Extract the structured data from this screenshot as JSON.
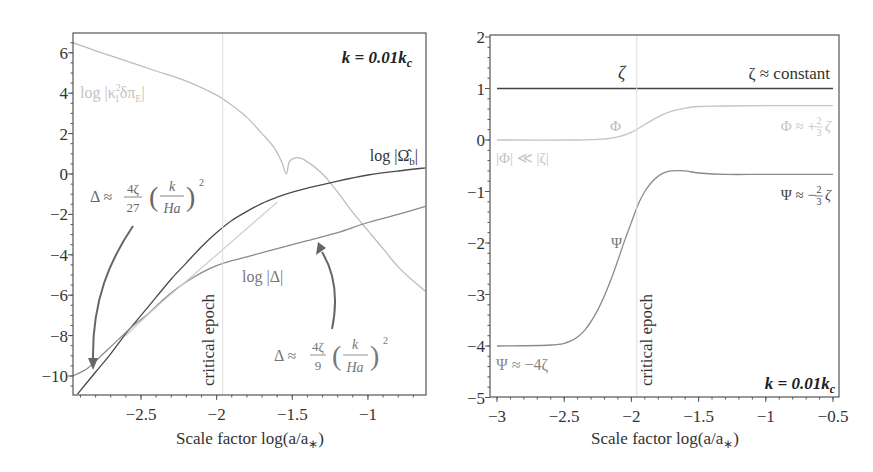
{
  "chart_data": [
    {
      "type": "line",
      "panel": "left",
      "title": "",
      "annotation_title": "k = 0.01k_c",
      "xlabel": "Scale factor log(a/a*)",
      "ylabel": "",
      "xlim": [
        -2.95,
        -0.62
      ],
      "ylim": [
        -11,
        6.8
      ],
      "xticks": [
        -2.5,
        -2,
        -1.5,
        -1
      ],
      "xtick_labels": [
        "−2.5",
        "−2",
        "−1.5",
        "−1"
      ],
      "yticks": [
        6,
        4,
        2,
        0,
        -2,
        -4,
        -6,
        -8,
        -10
      ],
      "ytick_labels": [
        "6",
        "4",
        "2",
        "0",
        "−2",
        "−4",
        "−6",
        "−8",
        "−10"
      ],
      "grid": false,
      "vline": {
        "x": -1.96,
        "label": "critical epoch"
      },
      "series": [
        {
          "name": "log|κ₁²δπ_E|",
          "color": "#bdbdbd",
          "x": [
            -2.95,
            -2.8,
            -2.6,
            -2.4,
            -2.2,
            -2.0,
            -1.9,
            -1.8,
            -1.7,
            -1.62,
            -1.57,
            -1.54,
            -1.52,
            -1.48,
            -1.42,
            -1.3,
            -1.2,
            -1.1,
            -1.0,
            -0.9,
            -0.8,
            -0.7,
            -0.62
          ],
          "y": [
            6.5,
            6.1,
            5.6,
            5.1,
            4.6,
            3.9,
            3.4,
            2.8,
            2.0,
            1.3,
            0.6,
            0.0,
            0.6,
            0.8,
            0.7,
            0.0,
            -0.9,
            -1.9,
            -2.8,
            -3.7,
            -4.6,
            -5.3,
            -5.8
          ]
        },
        {
          "name": "log|Ω̂_b|",
          "color": "#4a4a4a",
          "x": [
            -2.92,
            -2.8,
            -2.7,
            -2.6,
            -2.5,
            -2.4,
            -2.3,
            -2.2,
            -2.1,
            -2.0,
            -1.9,
            -1.8,
            -1.7,
            -1.6,
            -1.5,
            -1.4,
            -1.2,
            -1.0,
            -0.8,
            -0.62
          ],
          "y": [
            -10.9,
            -9.8,
            -8.9,
            -7.9,
            -7.0,
            -6.1,
            -5.2,
            -4.4,
            -3.6,
            -2.9,
            -2.3,
            -1.85,
            -1.45,
            -1.15,
            -0.9,
            -0.7,
            -0.35,
            -0.05,
            0.15,
            0.3
          ]
        },
        {
          "name": "log|Δ|",
          "color": "#8a8a8a",
          "x": [
            -2.95,
            -2.85,
            -2.75,
            -2.65,
            -2.55,
            -2.45,
            -2.35,
            -2.25,
            -2.15,
            -2.05,
            -1.95,
            -1.8,
            -1.6,
            -1.4,
            -1.2,
            -1.0,
            -0.8,
            -0.62
          ],
          "y": [
            -10.0,
            -9.6,
            -8.9,
            -8.2,
            -7.5,
            -6.9,
            -6.2,
            -5.6,
            -5.1,
            -4.7,
            -4.4,
            -4.1,
            -3.7,
            -3.3,
            -2.9,
            -2.4,
            -2.0,
            -1.6
          ]
        },
        {
          "name": "Δ ≈ (4ζ/9)(k/Ha)² asymptote",
          "color": "#d0d0d0",
          "x": [
            -2.6,
            -2.4,
            -2.2,
            -2.0,
            -1.8,
            -1.6
          ],
          "y": [
            -8.0,
            -6.6,
            -5.3,
            -4.0,
            -2.7,
            -1.4
          ]
        }
      ],
      "labels": [
        {
          "text": "k = 0.01k_c",
          "x": -0.8,
          "y": 5.9
        },
        {
          "text": "log|κ₁²δπ_E|",
          "x": -2.75,
          "y": 4.1
        },
        {
          "text": "log|Ω̂_b|",
          "x": -0.9,
          "y": 1.0
        },
        {
          "text": "log|Δ|",
          "x": -1.8,
          "y": -5.2
        },
        {
          "text": "Δ ≈ (4ζ/27)(k/Ha)²",
          "x": -2.7,
          "y": -1.6
        },
        {
          "text": "Δ ≈ (4ζ/9)(k/Ha)²",
          "x": -1.4,
          "y": -8.7
        }
      ]
    },
    {
      "type": "line",
      "panel": "right",
      "title": "",
      "annotation_title": "k = 0.01k_c",
      "xlabel": "Scale factor log(a/a*)",
      "ylabel": "",
      "xlim": [
        -3.05,
        -0.45
      ],
      "ylim": [
        -5,
        2
      ],
      "xticks": [
        -3,
        -2.5,
        -2,
        -1.5,
        -1,
        -0.5
      ],
      "xtick_labels": [
        "−3",
        "−2.5",
        "−2",
        "−1.5",
        "−1",
        "−0.5"
      ],
      "yticks": [
        2,
        1,
        0,
        -1,
        -2,
        -3,
        -4,
        -5
      ],
      "ytick_labels": [
        "2",
        "1",
        "0",
        "−1",
        "−2",
        "−3",
        "−4",
        "−5"
      ],
      "grid": false,
      "vline": {
        "x": -1.96,
        "label": "critical epoch"
      },
      "series": [
        {
          "name": "ζ",
          "color": "#444444",
          "x": [
            -3.0,
            -0.5
          ],
          "y": [
            1.0,
            1.0
          ]
        },
        {
          "name": "Φ",
          "color": "#c4c4c4",
          "x": [
            -3.0,
            -2.4,
            -2.2,
            -2.1,
            -2.0,
            -1.9,
            -1.8,
            -1.7,
            -1.6,
            -1.5,
            -1.3,
            -1.0,
            -0.5
          ],
          "y": [
            0.0,
            0.0,
            0.02,
            0.06,
            0.15,
            0.3,
            0.45,
            0.56,
            0.62,
            0.65,
            0.66,
            0.667,
            0.667
          ]
        },
        {
          "name": "Ψ",
          "color": "#8a8a8a",
          "x": [
            -3.0,
            -2.6,
            -2.45,
            -2.35,
            -2.25,
            -2.15,
            -2.05,
            -2.0,
            -1.95,
            -1.9,
            -1.85,
            -1.8,
            -1.75,
            -1.7,
            -1.6,
            -1.5,
            -1.3,
            -1.0,
            -0.5
          ],
          "y": [
            -4.0,
            -3.98,
            -3.9,
            -3.7,
            -3.3,
            -2.7,
            -1.95,
            -1.6,
            -1.25,
            -1.0,
            -0.82,
            -0.7,
            -0.63,
            -0.6,
            -0.6,
            -0.64,
            -0.667,
            -0.667,
            -0.667
          ]
        }
      ],
      "labels": [
        {
          "text": "ζ",
          "x": -2.1,
          "y": 1.25
        },
        {
          "text": "ζ ≈ constant",
          "x": -0.6,
          "y": 1.25
        },
        {
          "text": "Φ",
          "x": -2.1,
          "y": 0.2
        },
        {
          "text": "Φ ≈ +⅔ζ",
          "x": -0.6,
          "y": 0.3
        },
        {
          "text": "|Φ| ≪ |ζ|",
          "x": -3.0,
          "y": -0.35
        },
        {
          "text": "Ψ ≈ −⅔ζ",
          "x": -0.6,
          "y": -1.05
        },
        {
          "text": "Ψ",
          "x": -2.1,
          "y": -2.05
        },
        {
          "text": "Ψ ≈ −4ζ",
          "x": -3.0,
          "y": -4.35
        },
        {
          "text": "k = 0.01k_c",
          "x": -0.55,
          "y": -4.7
        }
      ]
    }
  ],
  "left": {
    "k_label": "k = 0.01k",
    "k_sub": "c",
    "kappa_label": "log |κ",
    "kappa_rest": "δπ",
    "omega_label": "log |Ω̂",
    "omega_sub": "b",
    "delta_label": "log |Δ|",
    "crit": "critical epoch",
    "xlabel": "Scale factor log(a/a",
    "xlabel_star": "∗",
    "ann27": {
      "lhs": "Δ ≈",
      "num": "4ζ",
      "den": "27",
      "inner_num": "k",
      "inner_den": "Ha",
      "exp": "2"
    },
    "ann9": {
      "lhs": "Δ ≈",
      "num": "4ζ",
      "den": "9",
      "inner_num": "k",
      "inner_den": "Ha",
      "exp": "2"
    }
  },
  "right": {
    "zeta": "ζ",
    "zeta_const": "ζ ≈ constant",
    "phi": "Φ",
    "phi_asym": "Φ ≈ +",
    "phi_small": "|Φ| ≪ |ζ|",
    "psi": "Ψ",
    "psi_asym": "Ψ ≈ −",
    "psi_early": "Ψ ≈ −4ζ",
    "frac_num": "2",
    "frac_den": "3",
    "zeta_sym": "ζ",
    "crit": "critical epoch",
    "k_label": "k = 0.01k",
    "k_sub": "c",
    "xlabel": "Scale factor log(a/a",
    "xlabel_star": "∗"
  }
}
